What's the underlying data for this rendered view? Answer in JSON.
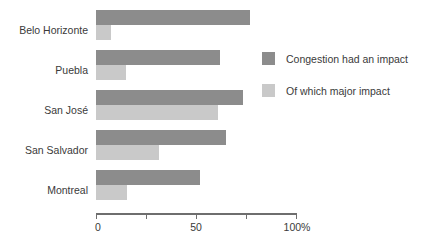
{
  "chart_data": {
    "type": "bar",
    "orientation": "horizontal",
    "title": "",
    "xlabel": "",
    "ylabel": "",
    "xlim": [
      0,
      100
    ],
    "grid": false,
    "legend_position": "right",
    "categories": [
      "Belo Horizonte",
      "Puebla",
      "San José",
      "San Salvador",
      "Montreal"
    ],
    "tick_values": [
      0,
      25,
      50,
      75,
      100
    ],
    "tick_labels": [
      "0",
      "",
      "50",
      "",
      "100%"
    ],
    "series": [
      {
        "name": "Congestion had an impact",
        "color": "#8c8c8c",
        "values": [
          77,
          62,
          73.5,
          65,
          52
        ]
      },
      {
        "name": "Of which major impact",
        "color": "#c9c9c9",
        "values": [
          7.5,
          15,
          61,
          31.5,
          15.5
        ]
      }
    ]
  },
  "legend": {
    "items": [
      {
        "label": "Congestion had an impact"
      },
      {
        "label": "Of which major impact"
      }
    ]
  },
  "colors": {
    "major": "#8c8c8c",
    "minor": "#c9c9c9",
    "axis": "#6e6e6e",
    "text": "#3a3a3a",
    "background": "#ffffff"
  }
}
